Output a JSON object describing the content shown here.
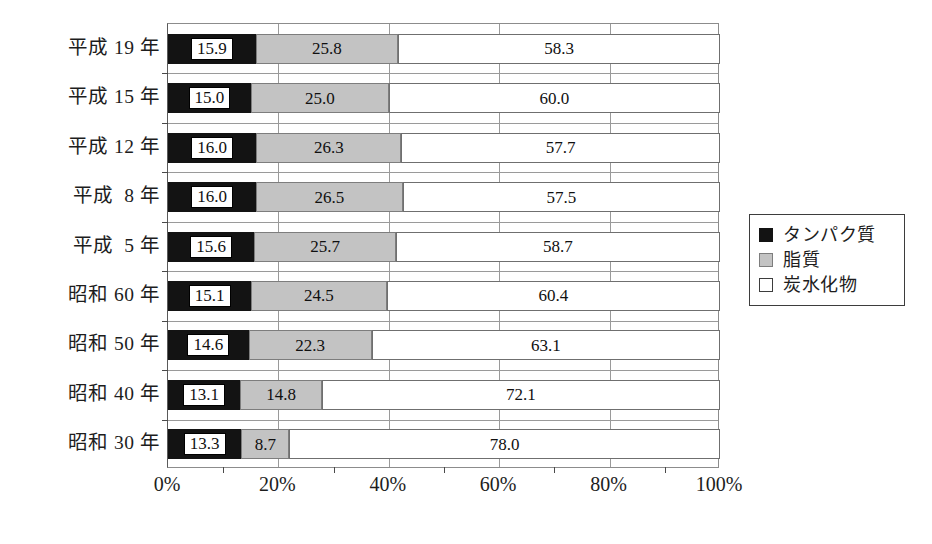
{
  "chart_data": {
    "type": "bar",
    "orientation": "horizontal",
    "stacked": true,
    "normalized": true,
    "title": "",
    "xlabel": "",
    "ylabel": "",
    "xlim": [
      0,
      100
    ],
    "xticks": [
      "0%",
      "20%",
      "40%",
      "60%",
      "80%",
      "100%"
    ],
    "xtick_values": [
      0,
      20,
      40,
      60,
      80,
      100
    ],
    "minor_xtick_values": [
      10,
      30,
      50,
      70,
      90
    ],
    "grid": "vertical-major",
    "legend_position": "right",
    "categories": [
      "平成 19 年",
      "平成 15 年",
      "平成 12 年",
      "平成  8 年",
      "平成  5 年",
      "昭和 60 年",
      "昭和 50 年",
      "昭和 40 年",
      "昭和 30 年"
    ],
    "series": [
      {
        "name": "タンパク質",
        "color": "#131313",
        "values": [
          15.9,
          15.0,
          16.0,
          16.0,
          15.6,
          15.1,
          14.6,
          13.1,
          13.3
        ],
        "labels": [
          "15.9",
          "15.0",
          "16.0",
          "16.0",
          "15.6",
          "15.1",
          "14.6",
          "13.1",
          "13.3"
        ]
      },
      {
        "name": "脂質",
        "color": "#c3c3c3",
        "values": [
          25.8,
          25.0,
          26.3,
          26.5,
          25.7,
          24.5,
          22.3,
          14.8,
          8.7
        ],
        "labels": [
          "25.8",
          "25.0",
          "26.3",
          "26.5",
          "25.7",
          "24.5",
          "22.3",
          "14.8",
          "8.7"
        ]
      },
      {
        "name": "炭水化物",
        "color": "#ffffff",
        "values": [
          58.3,
          60.0,
          57.7,
          57.5,
          58.7,
          60.4,
          63.1,
          72.1,
          78.0
        ],
        "labels": [
          "58.3",
          "60.0",
          "57.7",
          "57.5",
          "58.7",
          "60.4",
          "63.1",
          "72.1",
          "78.0"
        ]
      }
    ]
  },
  "legend": {
    "items": [
      {
        "label": "タンパク質",
        "swatch": "black-square-icon"
      },
      {
        "label": "脂質",
        "swatch": "gray-square-icon"
      },
      {
        "label": "炭水化物",
        "swatch": "white-square-icon"
      }
    ]
  }
}
